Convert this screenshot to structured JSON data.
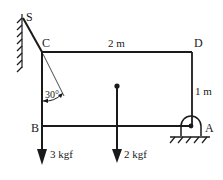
{
  "diagram": {
    "points": {
      "S": "S",
      "C": "C",
      "D": "D",
      "B": "B",
      "A": "A"
    },
    "dimensions": {
      "top_length": "2 m",
      "right_height": "1 m"
    },
    "angle": {
      "label": "30°"
    },
    "forces": {
      "at_B": "3 kgf",
      "center": "2 kgf"
    },
    "colors": {
      "stroke": "#1a1a1a",
      "background": "#ffffff"
    }
  }
}
